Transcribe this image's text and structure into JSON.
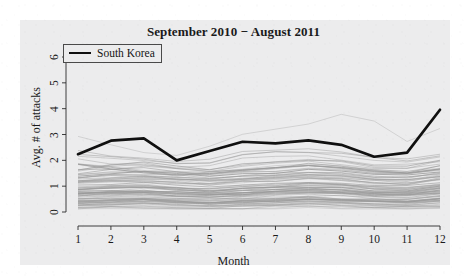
{
  "chart_data": {
    "type": "line",
    "title": "September 2010 − August 2011",
    "xlabel": "Month",
    "ylabel": "Avg. # of attacks",
    "xlim": [
      1,
      12
    ],
    "ylim": [
      0,
      6
    ],
    "xticks": [
      "1",
      "2",
      "3",
      "4",
      "5",
      "6",
      "7",
      "8",
      "9",
      "10",
      "11",
      "12"
    ],
    "yticks": [
      "0",
      "1",
      "2",
      "3",
      "4",
      "5",
      "6"
    ],
    "grid": false,
    "legend": {
      "position": "top-left",
      "entries": [
        {
          "label": "South Korea",
          "color": "#101010",
          "width": 2.6
        }
      ]
    },
    "x": [
      1,
      2,
      3,
      4,
      5,
      6,
      7,
      8,
      9,
      10,
      11,
      12
    ],
    "highlight_series": {
      "name": "South Korea",
      "color": "#101010",
      "values": [
        2.24,
        2.76,
        2.85,
        2.0,
        2.36,
        2.72,
        2.66,
        2.77,
        2.6,
        2.14,
        2.3,
        3.96
      ]
    },
    "background_series_color": "#9a9a9a",
    "background_series_note": "Dense bundle of other countries drawn as thin gray lines",
    "series": [
      {
        "name": "South Korea",
        "values": [
          2.24,
          2.76,
          2.85,
          2.0,
          2.36,
          2.72,
          2.66,
          2.77,
          2.6,
          2.14,
          2.3,
          3.96
        ]
      },
      {
        "name": "other-01",
        "values": [
          2.95,
          2.62,
          2.3,
          2.18,
          2.5,
          3.02,
          3.18,
          3.45,
          3.76,
          3.5,
          2.72,
          3.2
        ]
      },
      {
        "name": "other-02",
        "values": [
          2.2,
          2.05,
          1.95,
          1.84,
          1.9,
          2.22,
          2.3,
          2.28,
          2.2,
          2.02,
          1.96,
          2.12
        ]
      },
      {
        "name": "other-03",
        "values": [
          1.62,
          1.8,
          1.86,
          1.7,
          1.62,
          1.78,
          1.9,
          2.0,
          1.92,
          1.74,
          1.7,
          1.95
        ]
      },
      {
        "name": "other-04",
        "values": [
          1.85,
          1.7,
          1.58,
          1.46,
          1.5,
          1.62,
          1.7,
          1.78,
          1.72,
          1.58,
          1.5,
          1.68
        ]
      },
      {
        "name": "other-05",
        "values": [
          1.45,
          1.52,
          1.6,
          1.5,
          1.42,
          1.5,
          1.58,
          1.66,
          1.62,
          1.5,
          1.44,
          1.6
        ]
      },
      {
        "name": "other-06",
        "values": [
          1.3,
          1.38,
          1.42,
          1.34,
          1.28,
          1.36,
          1.44,
          1.5,
          1.46,
          1.34,
          1.3,
          1.46
        ]
      },
      {
        "name": "other-07",
        "values": [
          1.2,
          1.26,
          1.3,
          1.22,
          1.16,
          1.24,
          1.32,
          1.38,
          1.34,
          1.22,
          1.18,
          1.34
        ]
      },
      {
        "name": "other-08",
        "values": [
          1.1,
          1.16,
          1.2,
          1.12,
          1.06,
          1.14,
          1.22,
          1.28,
          1.24,
          1.12,
          1.08,
          1.24
        ]
      },
      {
        "name": "other-09",
        "values": [
          1.0,
          1.06,
          1.1,
          1.02,
          0.96,
          1.04,
          1.12,
          1.18,
          1.14,
          1.02,
          0.98,
          1.14
        ]
      },
      {
        "name": "other-10",
        "values": [
          0.92,
          0.97,
          1.0,
          0.94,
          0.88,
          0.95,
          1.02,
          1.08,
          1.04,
          0.94,
          0.9,
          1.05
        ]
      },
      {
        "name": "other-11",
        "values": [
          0.84,
          0.89,
          0.92,
          0.86,
          0.8,
          0.87,
          0.94,
          0.99,
          0.95,
          0.86,
          0.82,
          0.96
        ]
      },
      {
        "name": "other-12",
        "values": [
          0.76,
          0.81,
          0.84,
          0.78,
          0.73,
          0.79,
          0.86,
          0.9,
          0.87,
          0.78,
          0.75,
          0.88
        ]
      },
      {
        "name": "other-13",
        "values": [
          0.68,
          0.73,
          0.76,
          0.7,
          0.65,
          0.71,
          0.78,
          0.82,
          0.79,
          0.7,
          0.67,
          0.8
        ]
      },
      {
        "name": "other-14",
        "values": [
          0.6,
          0.65,
          0.68,
          0.62,
          0.58,
          0.63,
          0.7,
          0.74,
          0.71,
          0.63,
          0.6,
          0.72
        ]
      },
      {
        "name": "other-15",
        "values": [
          0.52,
          0.57,
          0.6,
          0.54,
          0.5,
          0.55,
          0.61,
          0.65,
          0.62,
          0.55,
          0.52,
          0.63
        ]
      },
      {
        "name": "other-16",
        "values": [
          0.45,
          0.49,
          0.52,
          0.47,
          0.43,
          0.48,
          0.53,
          0.57,
          0.54,
          0.48,
          0.45,
          0.55
        ]
      },
      {
        "name": "other-17",
        "values": [
          0.38,
          0.42,
          0.44,
          0.4,
          0.36,
          0.41,
          0.46,
          0.49,
          0.46,
          0.41,
          0.38,
          0.47
        ]
      },
      {
        "name": "other-18",
        "values": [
          0.31,
          0.34,
          0.36,
          0.33,
          0.3,
          0.34,
          0.38,
          0.41,
          0.38,
          0.34,
          0.31,
          0.39
        ]
      },
      {
        "name": "other-19",
        "values": [
          0.25,
          0.28,
          0.29,
          0.26,
          0.24,
          0.27,
          0.31,
          0.33,
          0.31,
          0.27,
          0.25,
          0.32
        ]
      },
      {
        "name": "other-20",
        "values": [
          0.2,
          0.22,
          0.23,
          0.21,
          0.19,
          0.22,
          0.25,
          0.27,
          0.25,
          0.22,
          0.2,
          0.26
        ]
      }
    ]
  }
}
